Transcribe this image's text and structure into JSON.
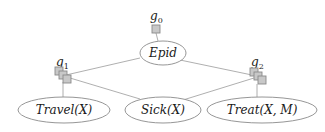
{
  "diagram": {
    "type": "factor-graph",
    "factors": [
      {
        "id": "g0",
        "label": "g",
        "subscript": "0"
      },
      {
        "id": "g1",
        "label": "g",
        "subscript": "1"
      },
      {
        "id": "g2",
        "label": "g",
        "subscript": "2"
      }
    ],
    "nodes": [
      {
        "id": "epid",
        "label": "Epid"
      },
      {
        "id": "travel",
        "label": "Travel(X)"
      },
      {
        "id": "sick",
        "label": "Sick(X)"
      },
      {
        "id": "treat",
        "label": "Treat(X, M)"
      }
    ],
    "edges": [
      {
        "from": "g0",
        "to": "epid"
      },
      {
        "from": "epid",
        "to": "g1"
      },
      {
        "from": "epid",
        "to": "g2"
      },
      {
        "from": "g1",
        "to": "travel"
      },
      {
        "from": "g1",
        "to": "sick"
      },
      {
        "from": "g2",
        "to": "sick"
      },
      {
        "from": "g2",
        "to": "treat"
      }
    ]
  }
}
